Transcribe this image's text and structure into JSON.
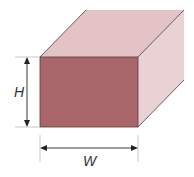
{
  "diagram": {
    "type": "rectangular-prism-cross-section",
    "labels": {
      "height": "H",
      "width": "W"
    },
    "colors": {
      "front_face": "#a8656a",
      "top_face": "#e3c3c6",
      "side_face": "#ead2d4",
      "edge": "#4a3a3c",
      "dimension_line": "#222222",
      "extension_line": "#bbbbbb"
    }
  }
}
